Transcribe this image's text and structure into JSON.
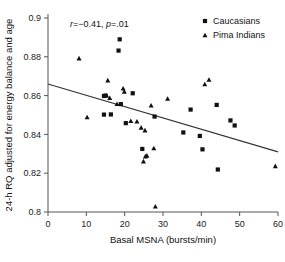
{
  "chart_data": {
    "type": "scatter",
    "title": "",
    "xlabel": "Basal MSNA (bursts/min)",
    "ylabel": "24-h RQ adjusted for energy balance and age",
    "xlim": [
      0,
      60
    ],
    "ylim": [
      0.8,
      0.9
    ],
    "xticks": [
      "0",
      "10",
      "20",
      "30",
      "40",
      "50",
      "60"
    ],
    "yticks": [
      "0.8",
      "0.82",
      "0.84",
      "0.86",
      "0.88",
      "0.9"
    ],
    "xtick_values": [
      0,
      10,
      20,
      30,
      40,
      50,
      60
    ],
    "ytick_values": [
      0.8,
      0.82,
      0.84,
      0.86,
      0.88,
      0.9
    ],
    "grid": false,
    "legend_position": "top-right",
    "annotation": {
      "full_text": "r=−0.41, p=.01",
      "r_symbol": "r",
      "r_value": "=−0.41,",
      "p_symbol": "p",
      "p_value": "=.01",
      "r": -0.41,
      "p": 0.01
    },
    "trendline": {
      "name": "regression-line",
      "x": [
        0,
        60
      ],
      "y": [
        0.866,
        0.831
      ],
      "slope": -0.000583,
      "intercept": 0.866
    },
    "series": [
      {
        "name": "Caucasians",
        "marker": "square",
        "color": "#111111",
        "points": [
          [
            18.7,
            0.889
          ],
          [
            18.4,
            0.8832
          ],
          [
            15.0,
            0.86
          ],
          [
            14.6,
            0.8598
          ],
          [
            22.1,
            0.8612
          ],
          [
            19.0,
            0.8556
          ],
          [
            20.3,
            0.8458
          ],
          [
            14.6,
            0.8502
          ],
          [
            16.4,
            0.8503
          ],
          [
            27.8,
            0.8492
          ],
          [
            24.6,
            0.8325
          ],
          [
            35.3,
            0.841
          ],
          [
            37.2,
            0.8528
          ],
          [
            39.6,
            0.8392
          ],
          [
            40.3,
            0.8323
          ],
          [
            44.3,
            0.8219
          ],
          [
            44.0,
            0.8552
          ],
          [
            47.6,
            0.8472
          ],
          [
            48.7,
            0.8446
          ]
        ]
      },
      {
        "name": "Pima Indians",
        "marker": "triangle",
        "color": "#111111",
        "points": [
          [
            8.1,
            0.8793
          ],
          [
            10.2,
            0.849
          ],
          [
            15.6,
            0.868
          ],
          [
            15.3,
            0.8602
          ],
          [
            16.1,
            0.8589
          ],
          [
            18.0,
            0.8558
          ],
          [
            19.6,
            0.8638
          ],
          [
            19.9,
            0.8622
          ],
          [
            21.6,
            0.847
          ],
          [
            23.2,
            0.8468
          ],
          [
            24.3,
            0.8436
          ],
          [
            25.3,
            0.8422
          ],
          [
            24.9,
            0.8262
          ],
          [
            25.4,
            0.8288
          ],
          [
            25.8,
            0.8292
          ],
          [
            26.9,
            0.855
          ],
          [
            27.6,
            0.833
          ],
          [
            28.0,
            0.803
          ],
          [
            31.2,
            0.8585
          ],
          [
            40.9,
            0.866
          ],
          [
            42.0,
            0.8683
          ],
          [
            59.3,
            0.8238
          ]
        ]
      }
    ],
    "legend": [
      {
        "label": "Caucasians",
        "marker": "square"
      },
      {
        "label": "Pima Indians",
        "marker": "triangle"
      }
    ]
  }
}
